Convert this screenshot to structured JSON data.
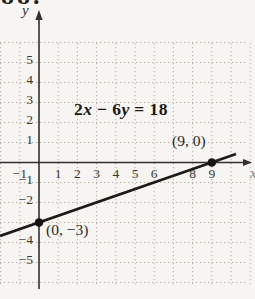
{
  "page": {
    "corner_fragment": "88."
  },
  "colors": {
    "background": "#f7f5f1",
    "axis": "#33302c",
    "grid_dots": "#b6b2a9",
    "line": "#1c1b18",
    "point": "#151412",
    "tick_text": "#3b3834",
    "equation_text": "#191815"
  },
  "chart_data": {
    "type": "line",
    "title": "2x − 6y = 18",
    "x_axis_label": "x",
    "y_axis_label": "y",
    "xlim": [
      -2,
      11.3
    ],
    "ylim": [
      -6.3,
      7.4
    ],
    "grid": true,
    "grid_x_range": [
      -2,
      11
    ],
    "grid_y_range": [
      -6,
      6
    ],
    "x_ticks": [
      {
        "v": -1,
        "label": "−1"
      },
      {
        "v": 1,
        "label": "1"
      },
      {
        "v": 2,
        "label": "2"
      },
      {
        "v": 3,
        "label": "3"
      },
      {
        "v": 4,
        "label": "4"
      },
      {
        "v": 5,
        "label": "5"
      },
      {
        "v": 6,
        "label": "6"
      },
      {
        "v": 8,
        "label": "8"
      },
      {
        "v": 9,
        "label": "9"
      }
    ],
    "y_ticks": [
      {
        "v": 5,
        "label": "5"
      },
      {
        "v": 4,
        "label": "4"
      },
      {
        "v": 3,
        "label": "3"
      },
      {
        "v": 2,
        "label": "2"
      },
      {
        "v": 1,
        "label": "1"
      },
      {
        "v": -1,
        "label": "−1"
      },
      {
        "v": -2,
        "label": "−2"
      },
      {
        "v": -4,
        "label": "−4"
      },
      {
        "v": -5,
        "label": "−5"
      }
    ],
    "equation": {
      "parts": {
        "p0": "2",
        "p1": "x",
        "p2": " − 6",
        "p3": "y",
        "p4": " = 18"
      }
    },
    "series": [
      {
        "name": "2x − 6y = 18",
        "points": [
          {
            "x": 0,
            "y": -3
          },
          {
            "x": 9,
            "y": 0
          }
        ]
      }
    ],
    "marked_points": [
      {
        "x": 9,
        "y": 0,
        "label": "(9, 0)"
      },
      {
        "x": 0,
        "y": -3,
        "label": "(0, −3)"
      }
    ]
  }
}
